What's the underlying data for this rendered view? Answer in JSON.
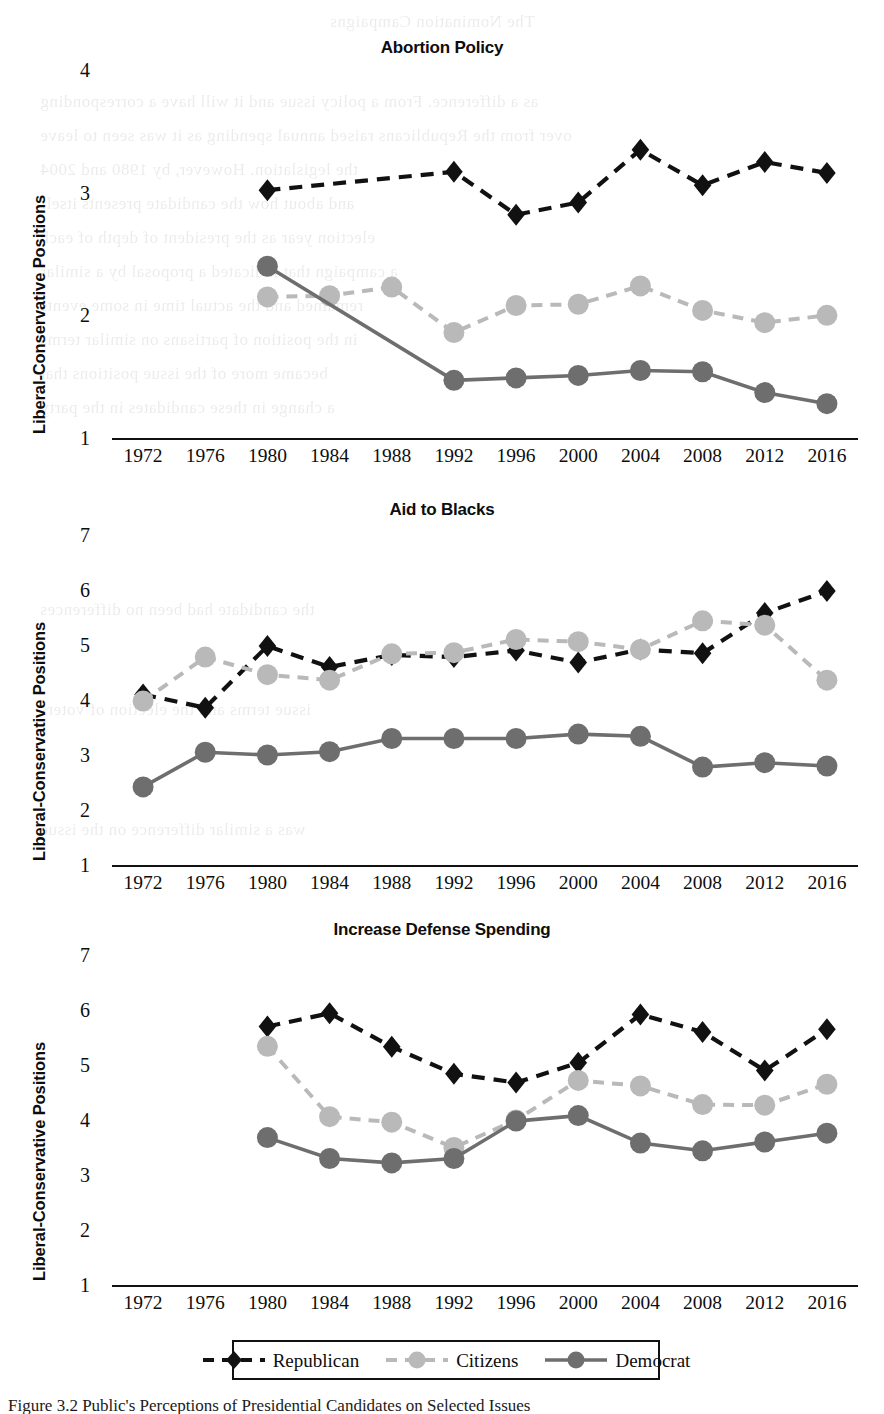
{
  "figure": {
    "ylabel": "Liberal-Conservative Positions",
    "caption": "Figure 3.2  Public's Perceptions of Presidential Candidates on Selected Issues",
    "colors": {
      "republican": "#111111",
      "citizens": "#b9b9b9",
      "democrat": "#6e6e6e",
      "axis": "#111111",
      "background": "#ffffff"
    }
  },
  "legend": {
    "items": [
      {
        "label": "Republican",
        "marker": "diamond-marker",
        "line": "dashed",
        "color": "#111111"
      },
      {
        "label": "Citizens",
        "marker": "circle-marker",
        "line": "dashed",
        "color": "#b9b9b9"
      },
      {
        "label": "Democrat",
        "marker": "circle-marker",
        "line": "solid",
        "color": "#6e6e6e"
      }
    ]
  },
  "chart_data": [
    {
      "type": "line",
      "title": "Abortion Policy",
      "xlabel": "",
      "ylabel": "Liberal-Conservative Positions",
      "categories": [
        "1972",
        "1976",
        "1980",
        "1984",
        "1988",
        "1992",
        "1996",
        "2000",
        "2004",
        "2008",
        "2012",
        "2016"
      ],
      "ylim": [
        1,
        4
      ],
      "yticks": [
        1,
        2,
        3,
        4
      ],
      "grid": false,
      "legend_position": "below-figure",
      "series": [
        {
          "name": "Republican",
          "values": [
            null,
            null,
            3.02,
            null,
            null,
            3.17,
            2.82,
            2.92,
            3.35,
            3.06,
            3.25,
            3.16
          ]
        },
        {
          "name": "Citizens",
          "values": [
            null,
            null,
            2.15,
            2.16,
            2.23,
            1.86,
            2.08,
            2.09,
            2.24,
            2.04,
            1.94,
            2.0
          ]
        },
        {
          "name": "Democrat",
          "values": [
            null,
            null,
            2.4,
            null,
            null,
            1.47,
            1.49,
            1.51,
            1.55,
            1.54,
            1.37,
            1.28
          ]
        }
      ]
    },
    {
      "type": "line",
      "title": "Aid to Blacks",
      "xlabel": "",
      "ylabel": "Liberal-Conservative Positions",
      "categories": [
        "1972",
        "1976",
        "1980",
        "1984",
        "1988",
        "1992",
        "1996",
        "2000",
        "2004",
        "2008",
        "2012",
        "2016"
      ],
      "ylim": [
        1,
        7
      ],
      "yticks": [
        1,
        2,
        3,
        4,
        5,
        6,
        7
      ],
      "grid": false,
      "legend_position": "below-figure",
      "series": [
        {
          "name": "Republican",
          "values": [
            4.1,
            3.86,
            4.98,
            4.6,
            4.82,
            4.78,
            4.9,
            4.68,
            4.92,
            4.85,
            5.58,
            5.98
          ]
        },
        {
          "name": "Citizens",
          "values": [
            3.98,
            4.78,
            4.46,
            4.36,
            4.84,
            4.86,
            5.1,
            5.06,
            4.92,
            5.44,
            5.36,
            4.36
          ]
        },
        {
          "name": "Democrat",
          "values": [
            2.42,
            3.05,
            3.0,
            3.06,
            3.3,
            3.3,
            3.3,
            3.38,
            3.34,
            2.78,
            2.86,
            2.8
          ]
        }
      ]
    },
    {
      "type": "line",
      "title": "Increase Defense Spending",
      "xlabel": "",
      "ylabel": "Liberal-Conservative Positions",
      "categories": [
        "1972",
        "1976",
        "1980",
        "1984",
        "1988",
        "1992",
        "1996",
        "2000",
        "2004",
        "2008",
        "2012",
        "2016"
      ],
      "ylim": [
        1,
        7
      ],
      "yticks": [
        1,
        2,
        3,
        4,
        5,
        6,
        7
      ],
      "grid": false,
      "legend_position": "below-figure",
      "series": [
        {
          "name": "Republican",
          "values": [
            null,
            null,
            5.7,
            5.94,
            5.33,
            4.84,
            4.68,
            5.04,
            5.92,
            5.6,
            4.9,
            5.65
          ]
        },
        {
          "name": "Citizens",
          "values": [
            null,
            null,
            5.34,
            4.06,
            3.96,
            3.5,
            4.0,
            4.72,
            4.62,
            4.28,
            4.27,
            4.65
          ]
        },
        {
          "name": "Democrat",
          "values": [
            null,
            null,
            3.68,
            3.3,
            3.22,
            3.3,
            3.98,
            4.08,
            3.58,
            3.44,
            3.6,
            3.76
          ]
        }
      ]
    }
  ],
  "ghost_text": [
    {
      "x": 330,
      "y": 12,
      "text": "The Nomination Campaigns"
    },
    {
      "x": 40,
      "y": 92,
      "text": "as a difference. From a policy issue and it will have a corresponding"
    },
    {
      "x": 40,
      "y": 126,
      "text": "over from the Republicans raised annual spending as it was seen to leave"
    },
    {
      "x": 40,
      "y": 160,
      "text": "the legislation. However, by 1980 and 2004"
    },
    {
      "x": 40,
      "y": 194,
      "text": "and about how the candidate presents itself"
    },
    {
      "x": 40,
      "y": 228,
      "text": "election year as the president of depth of each"
    },
    {
      "x": 40,
      "y": 262,
      "text": "a campaign that indicated a proposal by a similar"
    },
    {
      "x": 40,
      "y": 296,
      "text": "remained and the actual time in some events"
    },
    {
      "x": 40,
      "y": 330,
      "text": "in the position of partisans on similar terms"
    },
    {
      "x": 40,
      "y": 364,
      "text": "became more of the issue positions that"
    },
    {
      "x": 40,
      "y": 398,
      "text": "a change in these candidates in the party"
    },
    {
      "x": 40,
      "y": 600,
      "text": "the candidate had been no differences"
    },
    {
      "x": 40,
      "y": 700,
      "text": "issue terms and the election of voters"
    },
    {
      "x": 40,
      "y": 820,
      "text": "was a similar difference on the issue"
    }
  ]
}
